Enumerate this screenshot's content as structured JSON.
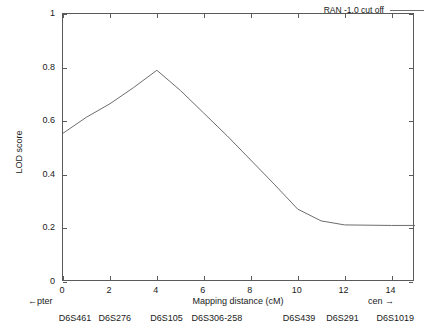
{
  "chart_data": {
    "type": "line",
    "title": "",
    "xlabel": "Mapping distance (cM)",
    "ylabel": "LOD score",
    "xlim": [
      0,
      15
    ],
    "ylim": [
      0,
      1
    ],
    "grid": false,
    "legend_position": "top-right",
    "x_ticks": [
      0,
      2,
      4,
      6,
      8,
      10,
      12,
      14
    ],
    "x_tick_labels": [
      "0",
      "2",
      "4",
      "6",
      "8",
      "10",
      "12",
      "14"
    ],
    "y_ticks": [
      0,
      0.2,
      0.4,
      0.6,
      0.8,
      1
    ],
    "y_tick_labels": [
      "0",
      "0.2",
      "0.4",
      "0.6",
      "0.8",
      "1"
    ],
    "series": [
      {
        "name": "RAN -1.0 cut off",
        "color": "#6d6d6d",
        "x": [
          0,
          1,
          2,
          3,
          4,
          5,
          6,
          7,
          8,
          9,
          10,
          11,
          12,
          13,
          14,
          15
        ],
        "values": [
          0.555,
          0.615,
          0.665,
          0.725,
          0.79,
          0.715,
          0.63,
          0.545,
          0.455,
          0.365,
          0.272,
          0.228,
          0.213,
          0.212,
          0.211,
          0.211
        ]
      }
    ],
    "annotations": {
      "left_orientation": "←pter",
      "right_orientation": "cen →",
      "markers": [
        {
          "label": "D6S461",
          "x": 0.55
        },
        {
          "label": "D6S276",
          "x": 2.25
        },
        {
          "label": "D6S105",
          "x": 4.45
        },
        {
          "label": "D6S306-258",
          "x": 6.6
        },
        {
          "label": "D6S439",
          "x": 10.1
        },
        {
          "label": "D6S291",
          "x": 11.95
        },
        {
          "label": "D6S1019",
          "x": 14.2
        }
      ]
    }
  },
  "legend": {
    "entry_label": "RAN -1.0 cut off"
  }
}
